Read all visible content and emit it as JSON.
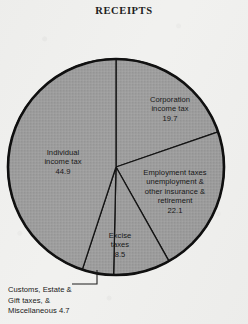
{
  "chart_data": {
    "type": "pie",
    "title": "RECEIPTS",
    "xlabel": "",
    "ylabel": "",
    "grid": false,
    "legend_position": "none",
    "start_angle_deg": 90,
    "direction": "clockwise",
    "categories": [
      "Corporation income tax",
      "Employment taxes unemployment & other insurance & retirement",
      "Excise taxes",
      "Customs, Estate & Gift taxes, & Miscellaneous",
      "Individual income tax"
    ],
    "values": [
      19.7,
      22.1,
      8.5,
      4.7,
      44.9
    ],
    "slices": [
      {
        "key": "corporation",
        "label_lines": [
          "Corporation",
          "income tax"
        ],
        "value": "19.7",
        "value_number": 19.7,
        "label_placement": "inside"
      },
      {
        "key": "employment",
        "label_lines": [
          "Employment taxes",
          "unemployment &",
          "other insurance &",
          "retirement"
        ],
        "value": "22.1",
        "value_number": 22.1,
        "label_placement": "inside"
      },
      {
        "key": "excise",
        "label_lines": [
          "Excise",
          "taxes"
        ],
        "value": "8.5",
        "value_number": 8.5,
        "label_placement": "inside"
      },
      {
        "key": "customs",
        "label_lines": [
          "Customs, Estate &",
          "Gift taxes, &",
          "Miscellaneous 4.7"
        ],
        "value": "4.7",
        "value_number": 4.7,
        "label_placement": "outside-with-leader"
      },
      {
        "key": "individual",
        "label_lines": [
          "Individual",
          "income tax"
        ],
        "value": "44.9",
        "value_number": 44.9,
        "label_placement": "inside"
      }
    ]
  },
  "colors": {
    "paper": "#f1f1ef",
    "slice_fill": "#9b9b9b",
    "outline": "#101010",
    "text": "#141414"
  }
}
